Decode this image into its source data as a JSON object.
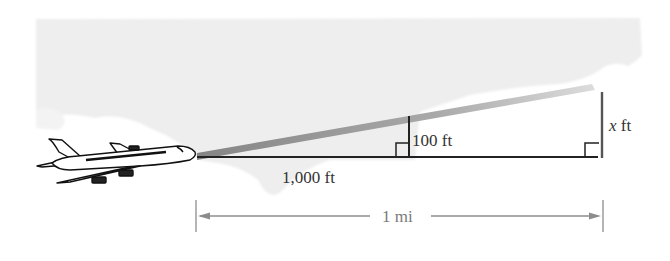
{
  "diagram": {
    "type": "airplane-climb-similar-triangles",
    "labels": {
      "short_leg_height": "100 ft",
      "short_leg_base": "1,000 ft",
      "tall_leg_height_var": "x",
      "tall_leg_height_unit": " ft",
      "total_distance": "1 mi"
    },
    "colors": {
      "cloud": "#eeeeee",
      "beam_start": "#8a8a8a",
      "beam_end": "#d8d8d8",
      "lines": "#222222",
      "dimension": "#8c8c8c",
      "airplane_fill": "#ffffff",
      "airplane_stroke": "#111111"
    }
  }
}
